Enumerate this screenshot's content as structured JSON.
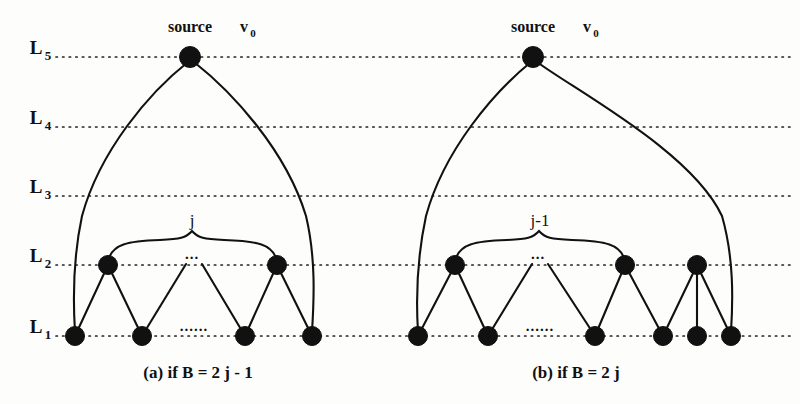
{
  "figure": {
    "background_color": "#fdfdfb",
    "ink_color": "#111111",
    "width": 800,
    "height": 404
  },
  "levels": [
    {
      "id": "L5",
      "base": "L",
      "subscript": "5",
      "y": 57,
      "label_x": 36
    },
    {
      "id": "L4",
      "base": "L",
      "subscript": "4",
      "y": 127,
      "label_x": 36
    },
    {
      "id": "L3",
      "base": "L",
      "subscript": "3",
      "y": 196,
      "label_x": 36
    },
    {
      "id": "L2",
      "base": "L",
      "subscript": "2",
      "y": 265,
      "label_x": 36
    },
    {
      "id": "L1",
      "base": "L",
      "subscript": "1",
      "y": 336,
      "label_x": 36
    }
  ],
  "level_line": {
    "x_start": 56,
    "x_end": 792,
    "style": "dotted"
  },
  "panels": [
    {
      "id": "panel-a",
      "caption": "(a) if B = 2 j - 1",
      "caption_x": 198,
      "caption_y": 378,
      "source": {
        "label": "source",
        "vertex_base": "v",
        "vertex_sub": "0",
        "x": 190,
        "y": 57,
        "label_x": 190,
        "label_y": 32,
        "vertex_label_x": 248,
        "vertex_label_y": 32
      },
      "brace": {
        "label": "j",
        "label_x": 192,
        "label_y": 226,
        "left_x": 108,
        "right_x": 277,
        "top_y": 238,
        "bottom_y": 259
      },
      "ellipsis_upper": {
        "text": "...",
        "x": 192,
        "y": 258
      },
      "ellipsis_lower": {
        "text": "......",
        "x": 194,
        "y": 330
      },
      "nodes_L2": [
        {
          "x": 108,
          "y": 265
        },
        {
          "x": 277,
          "y": 265
        }
      ],
      "nodes_L1": [
        {
          "x": 75,
          "y": 336
        },
        {
          "x": 142,
          "y": 336
        },
        {
          "x": 245,
          "y": 336
        },
        {
          "x": 312,
          "y": 336
        }
      ],
      "edges_straight": [
        {
          "x1": 108,
          "y1": 265,
          "x2": 75,
          "y2": 336
        },
        {
          "x1": 108,
          "y1": 265,
          "x2": 142,
          "y2": 336
        },
        {
          "x1": 277,
          "y1": 265,
          "x2": 245,
          "y2": 336
        },
        {
          "x1": 277,
          "y1": 265,
          "x2": 312,
          "y2": 336
        },
        {
          "x1": 186,
          "y1": 264,
          "x2": 142,
          "y2": 336
        },
        {
          "x1": 202,
          "y1": 264,
          "x2": 245,
          "y2": 336
        }
      ],
      "edges_curved": [
        {
          "d": "M 188 62 C 150 92, 100 150, 82 216 C 73 258, 73 300, 75 332"
        },
        {
          "d": "M 194 62 C 232 92, 286 150, 306 216 C 316 258, 314 300, 312 332"
        }
      ]
    },
    {
      "id": "panel-b",
      "caption": "(b) if B = 2 j",
      "caption_x": 576,
      "caption_y": 378,
      "source": {
        "label": "source",
        "vertex_base": "v",
        "vertex_sub": "0",
        "x": 533,
        "y": 57,
        "label_x": 533,
        "label_y": 32,
        "vertex_label_x": 591,
        "vertex_label_y": 32
      },
      "brace": {
        "label": "j-1",
        "label_x": 540,
        "label_y": 226,
        "left_x": 455,
        "right_x": 625,
        "top_y": 238,
        "bottom_y": 259
      },
      "ellipsis_upper": {
        "text": "...",
        "x": 538,
        "y": 258
      },
      "ellipsis_lower": {
        "text": "......",
        "x": 540,
        "y": 330
      },
      "nodes_L2": [
        {
          "x": 455,
          "y": 265
        },
        {
          "x": 625,
          "y": 265
        },
        {
          "x": 697,
          "y": 265
        }
      ],
      "nodes_L1": [
        {
          "x": 418,
          "y": 336
        },
        {
          "x": 488,
          "y": 336
        },
        {
          "x": 595,
          "y": 336
        },
        {
          "x": 663,
          "y": 336
        },
        {
          "x": 697,
          "y": 336
        },
        {
          "x": 731,
          "y": 336
        }
      ],
      "edges_straight": [
        {
          "x1": 455,
          "y1": 265,
          "x2": 418,
          "y2": 336
        },
        {
          "x1": 455,
          "y1": 265,
          "x2": 488,
          "y2": 336
        },
        {
          "x1": 625,
          "y1": 265,
          "x2": 595,
          "y2": 336
        },
        {
          "x1": 625,
          "y1": 265,
          "x2": 663,
          "y2": 336
        },
        {
          "x1": 697,
          "y1": 265,
          "x2": 663,
          "y2": 336
        },
        {
          "x1": 697,
          "y1": 265,
          "x2": 697,
          "y2": 336
        },
        {
          "x1": 697,
          "y1": 265,
          "x2": 731,
          "y2": 336
        },
        {
          "x1": 532,
          "y1": 264,
          "x2": 488,
          "y2": 336
        },
        {
          "x1": 548,
          "y1": 264,
          "x2": 595,
          "y2": 336
        }
      ],
      "edges_curved": [
        {
          "d": "M 531 62 C 494 92, 444 150, 426 216 C 417 258, 416 300, 418 332"
        },
        {
          "d": "M 537 62 C 576 92, 690 150, 722 216 C 734 258, 733 300, 731 332"
        }
      ]
    }
  ],
  "node_radius": 9.5
}
